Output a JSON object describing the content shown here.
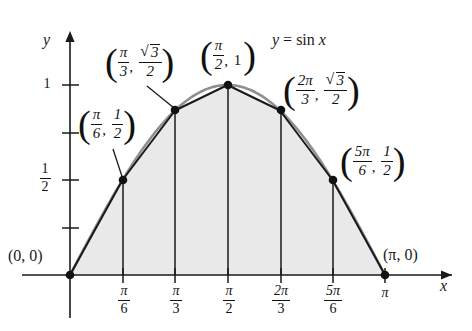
{
  "figure": {
    "title": "",
    "curve_label": {
      "y": "y",
      "eq": "=",
      "fn": "sin",
      "arg": "x"
    },
    "axes": {
      "x_label": "x",
      "y_label": "y",
      "x_ticks": [
        {
          "num": "π",
          "den": "6",
          "value": 0.5235987755982988
        },
        {
          "num": "π",
          "den": "3",
          "value": 1.0471975511965976
        },
        {
          "num": "π",
          "den": "2",
          "value": 1.5707963267948966
        },
        {
          "num": "2π",
          "den": "3",
          "value": 2.0943951023931953
        },
        {
          "num": "5π",
          "den": "6",
          "value": 2.6179938779914944
        },
        {
          "num": "π",
          "den": "",
          "value": 3.141592653589793
        }
      ],
      "y_ticks": [
        {
          "label": "1",
          "num": "",
          "den": "",
          "value": 1
        },
        {
          "label": "",
          "num": "3",
          "den": "4",
          "value": 0.75
        },
        {
          "label": "",
          "num": "1",
          "den": "2",
          "value": 0.5
        },
        {
          "label": "",
          "num": "1",
          "den": "4",
          "value": 0.25
        }
      ],
      "y_tick_visible_labels": [
        "1",
        "1/2"
      ]
    },
    "origin_label": "(0, 0)",
    "endpoint_label": "(π, 0)",
    "points": [
      {
        "name": "origin",
        "x_expr": "0",
        "y_expr": "0",
        "x": 0,
        "y": 0,
        "label_style": "plain",
        "label": "(0, 0)"
      },
      {
        "name": "pi-over-6",
        "x_num": "π",
        "x_den": "6",
        "y_num": "1",
        "y_den": "2",
        "x": 0.5235987755982988,
        "y": 0.5,
        "label_style": "fraction"
      },
      {
        "name": "pi-over-3",
        "x_num": "π",
        "x_den": "3",
        "y_num": "√3",
        "y_den": "2",
        "x": 1.0471975511965976,
        "y": 0.8660254037844386,
        "label_style": "fraction-sqrt"
      },
      {
        "name": "pi-over-2",
        "x_num": "π",
        "x_den": "2",
        "y_num": "1",
        "y_den": "",
        "x": 1.5707963267948966,
        "y": 1,
        "label_style": "fraction-scalar"
      },
      {
        "name": "two-pi-over-3",
        "x_num": "2π",
        "x_den": "3",
        "y_num": "√3",
        "y_den": "2",
        "x": 2.0943951023931953,
        "y": 0.8660254037844386,
        "label_style": "fraction-sqrt"
      },
      {
        "name": "five-pi-over-6",
        "x_num": "5π",
        "x_den": "6",
        "y_num": "1",
        "y_den": "2",
        "x": 2.6179938779914944,
        "y": 0.5,
        "label_style": "fraction"
      },
      {
        "name": "pi",
        "x_expr": "π",
        "y_expr": "0",
        "x": 3.141592653589793,
        "y": 0,
        "label_style": "plain",
        "label": "(π, 0)"
      }
    ],
    "colors": {
      "curve": "#8f8f8f",
      "chord": "#1a1a1a",
      "fill": "#e9e9e9",
      "axis": "#1a1a1a",
      "point": "#111111",
      "leader": "#1a1a1a"
    }
  },
  "chart_data": {
    "type": "line",
    "xlabel": "x",
    "ylabel": "y",
    "xlim": [
      0,
      3.141592653589793
    ],
    "ylim": [
      0,
      1.15
    ],
    "grid": false,
    "legend": null,
    "annotations": [
      "y = sin x",
      "(0, 0)",
      "(π/6, 1/2)",
      "(π/3, √3/2)",
      "(π/2, 1)",
      "(2π/3, √3/2)",
      "(5π/6, 1/2)",
      "(π, 0)"
    ],
    "x_tick_labels": [
      "π/6",
      "π/3",
      "π/2",
      "2π/3",
      "5π/6",
      "π"
    ],
    "x_tick_values": [
      0.5236,
      1.0472,
      1.5708,
      2.0944,
      2.618,
      3.1416
    ],
    "y_tick_labels": [
      "1/2",
      "1"
    ],
    "y_tick_values": [
      0.5,
      1
    ],
    "series": [
      {
        "name": "y = sin x",
        "type": "curve",
        "x": [
          0,
          0.5236,
          1.0472,
          1.5708,
          2.0944,
          2.618,
          3.1416
        ],
        "values": [
          0,
          0.5,
          0.866,
          1.0,
          0.866,
          0.5,
          0
        ]
      },
      {
        "name": "trapezoidal chords",
        "type": "polyline",
        "x": [
          0,
          0.5236,
          1.0472,
          1.5708,
          2.0944,
          2.618,
          3.1416
        ],
        "values": [
          0,
          0.5,
          0.866,
          1.0,
          0.866,
          0.5,
          0
        ]
      }
    ],
    "shaded_region": {
      "label": "area under trapezoids",
      "x_from": 0,
      "x_to": 3.141592653589793
    },
    "vertical_segments_at": [
      0.5236,
      1.0472,
      1.5708,
      2.0944,
      2.618
    ]
  }
}
